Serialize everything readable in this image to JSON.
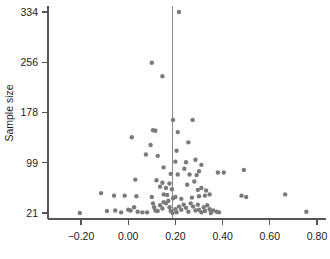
{
  "chart_data": {
    "type": "scatter",
    "title": "",
    "subtitle": "",
    "xlabel": "",
    "ylabel": "Sample size",
    "xlim": [
      -0.29,
      0.85
    ],
    "ylim": [
      11,
      345
    ],
    "grid": false,
    "legend": null,
    "marker_color": "#7a7a7a",
    "axis_color": "#555555",
    "reference_line": {
      "orientation": "vertical",
      "x": 0.188,
      "color": "#8a8a8a"
    },
    "xticks": [
      -0.2,
      0.0,
      0.2,
      0.4,
      0.6,
      0.8
    ],
    "xticklabels": [
      "-0.20",
      "0.00",
      "0.20",
      "0.40",
      "0.60",
      "0.80"
    ],
    "yticks": [
      21,
      99,
      178,
      256,
      334
    ],
    "yticklabels": [
      "21",
      "99",
      "178",
      "256",
      "334"
    ],
    "points": [
      {
        "x": 0.215,
        "y": 334
      },
      {
        "x": 0.1,
        "y": 255
      },
      {
        "x": 0.145,
        "y": 234
      },
      {
        "x": 0.19,
        "y": 166
      },
      {
        "x": 0.273,
        "y": 166
      },
      {
        "x": 0.105,
        "y": 150
      },
      {
        "x": 0.115,
        "y": 149
      },
      {
        "x": 0.21,
        "y": 147
      },
      {
        "x": 0.015,
        "y": 139
      },
      {
        "x": 0.255,
        "y": 131
      },
      {
        "x": 0.095,
        "y": 127
      },
      {
        "x": 0.205,
        "y": 118
      },
      {
        "x": 0.075,
        "y": 112
      },
      {
        "x": 0.125,
        "y": 110
      },
      {
        "x": 0.2,
        "y": 101
      },
      {
        "x": 0.245,
        "y": 100
      },
      {
        "x": 0.285,
        "y": 104
      },
      {
        "x": 0.31,
        "y": 96
      },
      {
        "x": 0.15,
        "y": 92
      },
      {
        "x": 0.238,
        "y": 90
      },
      {
        "x": 0.3,
        "y": 86
      },
      {
        "x": 0.49,
        "y": 88
      },
      {
        "x": 0.18,
        "y": 82
      },
      {
        "x": 0.21,
        "y": 81
      },
      {
        "x": 0.26,
        "y": 81
      },
      {
        "x": 0.29,
        "y": 80
      },
      {
        "x": 0.38,
        "y": 84
      },
      {
        "x": 0.405,
        "y": 84
      },
      {
        "x": 0.03,
        "y": 73
      },
      {
        "x": 0.12,
        "y": 72
      },
      {
        "x": 0.145,
        "y": 68
      },
      {
        "x": 0.175,
        "y": 67
      },
      {
        "x": 0.25,
        "y": 65
      },
      {
        "x": 0.28,
        "y": 70
      },
      {
        "x": 0.135,
        "y": 62
      },
      {
        "x": 0.16,
        "y": 60
      },
      {
        "x": 0.185,
        "y": 58
      },
      {
        "x": 0.295,
        "y": 57
      },
      {
        "x": 0.31,
        "y": 60
      },
      {
        "x": 0.33,
        "y": 56
      },
      {
        "x": -0.115,
        "y": 52
      },
      {
        "x": -0.06,
        "y": 48
      },
      {
        "x": -0.015,
        "y": 48
      },
      {
        "x": 0.035,
        "y": 47
      },
      {
        "x": 0.1,
        "y": 46
      },
      {
        "x": 0.15,
        "y": 50
      },
      {
        "x": 0.165,
        "y": 49
      },
      {
        "x": 0.19,
        "y": 44
      },
      {
        "x": 0.2,
        "y": 46
      },
      {
        "x": 0.225,
        "y": 43
      },
      {
        "x": 0.27,
        "y": 45
      },
      {
        "x": 0.3,
        "y": 47
      },
      {
        "x": 0.325,
        "y": 48
      },
      {
        "x": 0.345,
        "y": 50
      },
      {
        "x": 0.48,
        "y": 48
      },
      {
        "x": 0.5,
        "y": 46
      },
      {
        "x": 0.665,
        "y": 50
      },
      {
        "x": -0.205,
        "y": 21
      },
      {
        "x": -0.09,
        "y": 24
      },
      {
        "x": -0.055,
        "y": 25
      },
      {
        "x": -0.03,
        "y": 22
      },
      {
        "x": 0.0,
        "y": 26
      },
      {
        "x": 0.01,
        "y": 25
      },
      {
        "x": 0.025,
        "y": 30
      },
      {
        "x": 0.04,
        "y": 23
      },
      {
        "x": 0.06,
        "y": 22
      },
      {
        "x": 0.08,
        "y": 22
      },
      {
        "x": 0.105,
        "y": 36
      },
      {
        "x": 0.11,
        "y": 30
      },
      {
        "x": 0.115,
        "y": 25
      },
      {
        "x": 0.125,
        "y": 24
      },
      {
        "x": 0.135,
        "y": 33
      },
      {
        "x": 0.145,
        "y": 28
      },
      {
        "x": 0.15,
        "y": 38
      },
      {
        "x": 0.16,
        "y": 36
      },
      {
        "x": 0.17,
        "y": 40
      },
      {
        "x": 0.175,
        "y": 30
      },
      {
        "x": 0.18,
        "y": 24
      },
      {
        "x": 0.188,
        "y": 21
      },
      {
        "x": 0.2,
        "y": 27
      },
      {
        "x": 0.205,
        "y": 22
      },
      {
        "x": 0.215,
        "y": 31
      },
      {
        "x": 0.225,
        "y": 26
      },
      {
        "x": 0.235,
        "y": 34
      },
      {
        "x": 0.245,
        "y": 29
      },
      {
        "x": 0.255,
        "y": 23
      },
      {
        "x": 0.265,
        "y": 36
      },
      {
        "x": 0.275,
        "y": 31
      },
      {
        "x": 0.285,
        "y": 25
      },
      {
        "x": 0.295,
        "y": 34
      },
      {
        "x": 0.3,
        "y": 26
      },
      {
        "x": 0.31,
        "y": 22
      },
      {
        "x": 0.32,
        "y": 30
      },
      {
        "x": 0.325,
        "y": 24
      },
      {
        "x": 0.335,
        "y": 33
      },
      {
        "x": 0.345,
        "y": 27
      },
      {
        "x": 0.35,
        "y": 21
      },
      {
        "x": 0.36,
        "y": 25
      },
      {
        "x": 0.375,
        "y": 23
      },
      {
        "x": 0.385,
        "y": 22
      },
      {
        "x": 0.755,
        "y": 23
      }
    ]
  }
}
